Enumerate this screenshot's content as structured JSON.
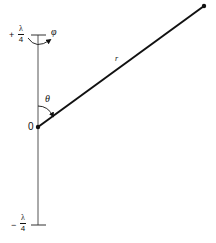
{
  "diagram": {
    "type": "dipole antenna geometry",
    "top_limit": {
      "sign": "+",
      "numerator": "λ",
      "denominator": "4"
    },
    "bottom_limit": {
      "sign": "−",
      "numerator": "λ",
      "denominator": "4"
    },
    "origin_label": "0",
    "radius_label": "r",
    "theta_label": "θ",
    "phi_label": "φ",
    "colors": {
      "line": "#111111",
      "axis": "#444444",
      "background": "#ffffff"
    }
  }
}
